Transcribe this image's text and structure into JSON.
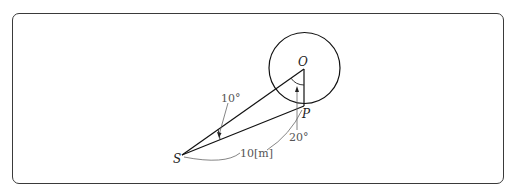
{
  "diagram": {
    "points": {
      "O": {
        "label": "O"
      },
      "P": {
        "label": "P"
      },
      "S": {
        "label": "S"
      }
    },
    "annotations": {
      "angle_at_S": "10°",
      "angle_at_O": "20°",
      "distance_SP": "10[m]"
    },
    "colors": {
      "line": "#111111",
      "annotation": "#666666",
      "border": "#3a3a3a"
    }
  }
}
